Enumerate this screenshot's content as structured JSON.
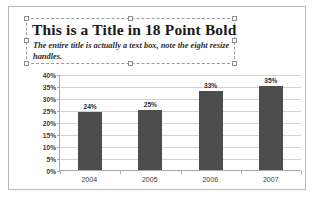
{
  "slide": {
    "title": "This is a Title in 18 Point Bold",
    "subtitle": "The entire title is actually a text box, note the eight resize handles."
  },
  "selection": {
    "handle_names": [
      "resize-handle-nw",
      "resize-handle-n",
      "resize-handle-ne",
      "resize-handle-w",
      "resize-handle-e",
      "resize-handle-sw",
      "resize-handle-s",
      "resize-handle-se"
    ],
    "handle_count": "8"
  },
  "colors": {
    "bar": "#4d4d4d",
    "gridline": "#d2d2d2",
    "axis": "#a8a8a8",
    "frame": "#b9b9b9",
    "selection_border": "#9a9a9a"
  },
  "chart_data": {
    "type": "bar",
    "title": "",
    "xlabel": "",
    "ylabel": "",
    "categories": [
      "2004",
      "2005",
      "2006",
      "2007"
    ],
    "values": [
      24,
      25,
      33,
      35
    ],
    "data_labels": [
      "24%",
      "25%",
      "33%",
      "35%"
    ],
    "ylim": [
      0,
      40
    ],
    "ytick_values": [
      0,
      5,
      10,
      15,
      20,
      25,
      30,
      35,
      40
    ],
    "ytick_labels": [
      "0%",
      "5%",
      "10%",
      "15%",
      "20%",
      "25%",
      "30%",
      "35%",
      "40%"
    ],
    "grid": true,
    "legend": false,
    "legend_position": "none"
  }
}
